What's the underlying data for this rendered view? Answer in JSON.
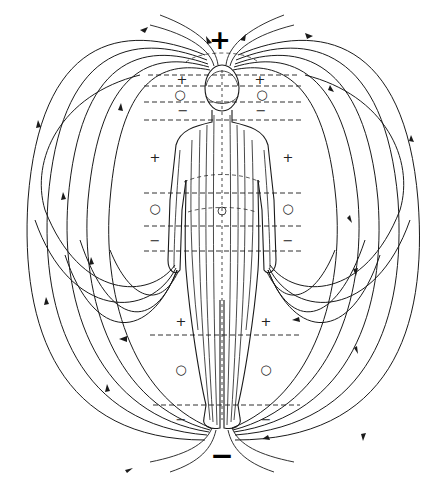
{
  "diagram": {
    "poles": {
      "top": {
        "label": "+",
        "x": 220,
        "y": 40
      },
      "bottom": {
        "label": "−",
        "x": 222,
        "y": 455
      }
    },
    "zone_markers": [
      {
        "label": "+",
        "x": 182,
        "y": 79
      },
      {
        "label": "○",
        "x": 180,
        "y": 94
      },
      {
        "label": "−",
        "x": 183,
        "y": 110
      },
      {
        "label": "+",
        "x": 260,
        "y": 79
      },
      {
        "label": "○",
        "x": 262,
        "y": 94
      },
      {
        "label": "−",
        "x": 261,
        "y": 110
      },
      {
        "label": "+",
        "x": 155,
        "y": 157
      },
      {
        "label": "○",
        "x": 155,
        "y": 208
      },
      {
        "label": "−",
        "x": 155,
        "y": 240
      },
      {
        "label": "+",
        "x": 288,
        "y": 157
      },
      {
        "label": "○",
        "x": 288,
        "y": 208
      },
      {
        "label": "−",
        "x": 288,
        "y": 240
      },
      {
        "label": "+",
        "x": 181,
        "y": 321
      },
      {
        "label": "○",
        "x": 181,
        "y": 369
      },
      {
        "label": "−",
        "x": 181,
        "y": 419
      },
      {
        "label": "+",
        "x": 266,
        "y": 321
      },
      {
        "label": "○",
        "x": 266,
        "y": 369
      },
      {
        "label": "−",
        "x": 266,
        "y": 419
      }
    ],
    "colors": {
      "line": "#1a1a1a",
      "background": "#ffffff"
    }
  }
}
